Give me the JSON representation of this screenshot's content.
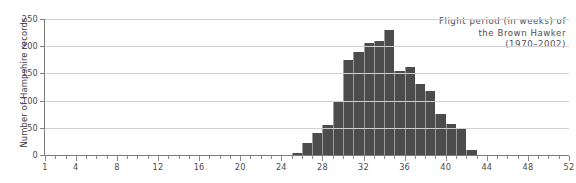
{
  "chart_data": {
    "type": "bar",
    "title_lines": [
      "Flight period (in weeks) of",
      "the Brown Hawker",
      "(1970–2002)"
    ],
    "xlabel": "",
    "ylabel": "Number of Hampshire records",
    "xlim": [
      1,
      52
    ],
    "ylim": [
      0,
      250
    ],
    "grid": true,
    "legend": null,
    "bar_color": "#4c4c4c",
    "grid_color": "#cfcfcf",
    "axis_color": "#7d7d7d",
    "y_ticks": [
      0,
      50,
      100,
      150,
      200,
      250
    ],
    "x_ticks": [
      1,
      4,
      8,
      12,
      16,
      20,
      24,
      28,
      32,
      36,
      40,
      44,
      48,
      52
    ],
    "x_minor_step": 1,
    "categories": [
      1,
      2,
      3,
      4,
      5,
      6,
      7,
      8,
      9,
      10,
      11,
      12,
      13,
      14,
      15,
      16,
      17,
      18,
      19,
      20,
      21,
      22,
      23,
      24,
      25,
      26,
      27,
      28,
      29,
      30,
      31,
      32,
      33,
      34,
      35,
      36,
      37,
      38,
      39,
      40,
      41,
      42,
      43,
      44,
      45,
      46,
      47,
      48,
      49,
      50,
      51,
      52
    ],
    "values": [
      0,
      0,
      0,
      0,
      0,
      0,
      0,
      0,
      0,
      0,
      0,
      0,
      0,
      0,
      0,
      0,
      0,
      0,
      0,
      0,
      0,
      0,
      0,
      0,
      3,
      22,
      40,
      55,
      100,
      175,
      190,
      205,
      210,
      230,
      155,
      162,
      130,
      118,
      75,
      57,
      48,
      9,
      0,
      0,
      0,
      0,
      0,
      0,
      0,
      0,
      0,
      0
    ]
  }
}
